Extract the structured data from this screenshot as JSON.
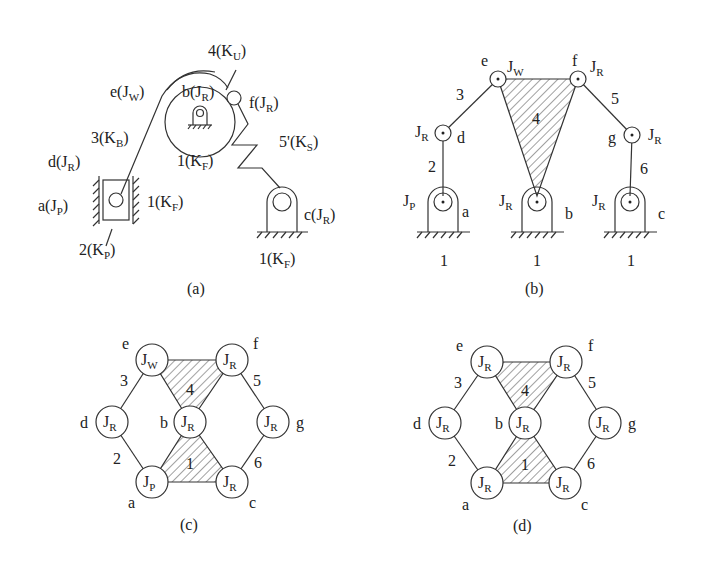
{
  "panels": {
    "a": {
      "caption": "(a)",
      "labels": {
        "ku": {
          "main": "4(K",
          "sub": "U",
          "end": ")"
        },
        "jw": {
          "main": "e(J",
          "sub": "W",
          "end": ")"
        },
        "b": {
          "main": "b(J",
          "sub": "R",
          "end": ")"
        },
        "f": {
          "main": "f(J",
          "sub": "R",
          "end": ")"
        },
        "kb": {
          "main": "3(K",
          "sub": "B",
          "end": ")"
        },
        "kf_mid": {
          "main": "1(K",
          "sub": "F",
          "end": ")"
        },
        "ks": {
          "main": "5'(K",
          "sub": "S",
          "end": ")"
        },
        "d": {
          "main": "d(J",
          "sub": "R",
          "end": ")"
        },
        "a": {
          "main": "a(J",
          "sub": "P",
          "end": ")"
        },
        "kf_left": {
          "main": "1(K",
          "sub": "F",
          "end": ")"
        },
        "kp": {
          "main": "2(K",
          "sub": "P",
          "end": ")"
        },
        "c": {
          "main": "c(J",
          "sub": "R",
          "end": ")"
        },
        "kf_right": {
          "main": "1(K",
          "sub": "F",
          "end": ")"
        }
      }
    },
    "b": {
      "caption": "(b)",
      "joints": {
        "e": {
          "name": "e",
          "type": "J",
          "sub": "W"
        },
        "f": {
          "name": "f",
          "type": "J",
          "sub": "R"
        },
        "d": {
          "name": "d",
          "type": "J",
          "sub": "R"
        },
        "g": {
          "name": "g",
          "type": "J",
          "sub": "R"
        },
        "a": {
          "name": "a",
          "type": "J",
          "sub": "P"
        },
        "b": {
          "name": "b",
          "type": "J",
          "sub": "R"
        },
        "c": {
          "name": "c",
          "type": "J",
          "sub": "R"
        }
      },
      "links": {
        "l2": "2",
        "l3": "3",
        "l4": "4",
        "l5": "5",
        "l6": "6",
        "ground_a": "1",
        "ground_b": "1",
        "ground_c": "1"
      }
    },
    "c": {
      "caption": "(c)",
      "nodes": {
        "e": {
          "name": "e",
          "type": "J",
          "sub": "W"
        },
        "f": {
          "name": "f",
          "type": "J",
          "sub": "R"
        },
        "d": {
          "name": "d",
          "type": "J",
          "sub": "R"
        },
        "b": {
          "name": "b",
          "type": "J",
          "sub": "R"
        },
        "g": {
          "name": "g",
          "type": "J",
          "sub": "R"
        },
        "a": {
          "name": "a",
          "type": "J",
          "sub": "P"
        },
        "c": {
          "name": "c",
          "type": "J",
          "sub": "R"
        }
      },
      "links": {
        "l1": "1",
        "l2": "2",
        "l3": "3",
        "l4": "4",
        "l5": "5",
        "l6": "6"
      }
    },
    "d": {
      "caption": "(d)",
      "nodes": {
        "e": {
          "name": "e",
          "type": "J",
          "sub": "R"
        },
        "f": {
          "name": "f",
          "type": "J",
          "sub": "R"
        },
        "d": {
          "name": "d",
          "type": "J",
          "sub": "R"
        },
        "b": {
          "name": "b",
          "type": "J",
          "sub": "R"
        },
        "g": {
          "name": "g",
          "type": "J",
          "sub": "R"
        },
        "a": {
          "name": "a",
          "type": "J",
          "sub": "R"
        },
        "c": {
          "name": "c",
          "type": "J",
          "sub": "R"
        }
      },
      "links": {
        "l1": "1",
        "l2": "2",
        "l3": "3",
        "l4": "4",
        "l5": "5",
        "l6": "6"
      }
    }
  }
}
